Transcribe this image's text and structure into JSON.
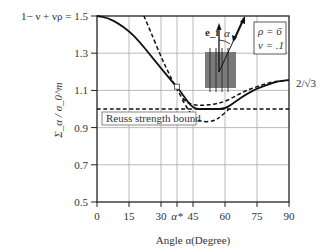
{
  "chart_data": {
    "type": "line",
    "title": "",
    "xlabel": "Angle α(Degree)",
    "ylabel": "Σ_α / σ_0^m",
    "xlim": [
      0,
      90
    ],
    "ylim": [
      0.5,
      1.5
    ],
    "x_ticks": [
      "0",
      "15",
      "30",
      "α*",
      "45",
      "60",
      "75",
      "90"
    ],
    "x_tick_values": [
      0,
      15,
      30,
      37.5,
      45,
      60,
      75,
      90
    ],
    "y_ticks": [
      "0.5",
      "0.7",
      "0.9",
      "1.1",
      "1.3",
      "1.5"
    ],
    "y_tick_values": [
      0.5,
      0.7,
      0.9,
      1.1,
      1.3,
      1.5
    ],
    "grid": true,
    "annotations": {
      "top_left_label": "1− ν + νρ = 1.5",
      "right_label": "2/√3",
      "reuss_label": "Reuss strength bound",
      "params": [
        "ρ = 6",
        "ν = .1"
      ],
      "fiber_label": "e_f",
      "angle_label": "α",
      "alpha_star_marker": 37.5
    },
    "series": [
      {
        "name": "solid-bound",
        "style": "solid",
        "x": [
          0,
          5,
          10,
          15,
          20,
          25,
          30,
          35,
          37.5,
          40,
          45,
          50,
          55,
          60,
          65,
          70,
          75,
          80,
          85,
          90
        ],
        "values": [
          1.5,
          1.49,
          1.46,
          1.42,
          1.36,
          1.29,
          1.22,
          1.15,
          1.12,
          1.08,
          1.0,
          1.0,
          1.0,
          1.0,
          1.04,
          1.08,
          1.11,
          1.13,
          1.15,
          1.155
        ]
      },
      {
        "name": "dashed-upper",
        "style": "dashed",
        "x": [
          22,
          25,
          30,
          35,
          40,
          45,
          50,
          55,
          60,
          65,
          70,
          75,
          80,
          85,
          90
        ],
        "values": [
          1.5,
          1.42,
          1.28,
          1.16,
          1.05,
          1.02,
          1.02,
          1.025,
          1.04,
          1.07,
          1.1,
          1.12,
          1.14,
          1.15,
          1.155
        ]
      },
      {
        "name": "dashed-lower",
        "style": "dashed",
        "x": [
          40,
          43,
          46,
          50,
          55,
          58,
          62
        ],
        "values": [
          1.05,
          0.99,
          0.945,
          0.93,
          0.935,
          0.96,
          1.0
        ]
      },
      {
        "name": "reuss-bound",
        "style": "dashed",
        "x": [
          0,
          90
        ],
        "values": [
          1.0,
          1.0
        ]
      }
    ]
  }
}
